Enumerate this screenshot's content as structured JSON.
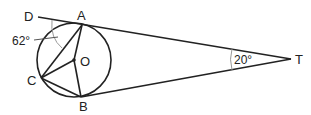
{
  "diagram": {
    "type": "geometry",
    "points": {
      "D": {
        "label": "D"
      },
      "A": {
        "label": "A"
      },
      "O": {
        "label": "O"
      },
      "C": {
        "label": "C"
      },
      "B": {
        "label": "B"
      },
      "T": {
        "label": "T"
      }
    },
    "angles": {
      "dac": "62°",
      "atb": "20°"
    },
    "colors": {
      "line": "#222222",
      "arc": "#999999",
      "background": "#ffffff"
    }
  }
}
